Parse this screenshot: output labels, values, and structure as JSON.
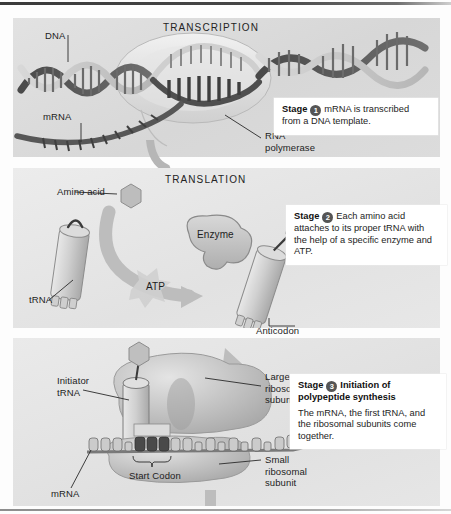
{
  "figure": {
    "background_color": "#fdfdfd",
    "panel_color": "#dedede"
  },
  "panels": [
    {
      "id": "transcription",
      "section_label": "TRANSCRIPTION",
      "labels": [
        {
          "name": "dna",
          "text": "DNA"
        },
        {
          "name": "mrna",
          "text": "mRNA"
        },
        {
          "name": "rna-polymerase",
          "text": "RNA\npolymerase"
        }
      ],
      "stage": {
        "word": "Stage",
        "number": "1",
        "title": "",
        "body": "mRNA is transcribed from a DNA template."
      }
    },
    {
      "id": "translation",
      "section_label": "TRANSLATION",
      "labels": [
        {
          "name": "amino-acid",
          "text": "Amino acid"
        },
        {
          "name": "trna",
          "text": "tRNA"
        },
        {
          "name": "enzyme",
          "text": "Enzyme"
        },
        {
          "name": "atp",
          "text": "ATP"
        },
        {
          "name": "anticodon",
          "text": "Anticodon"
        }
      ],
      "stage": {
        "word": "Stage",
        "number": "2",
        "title": "",
        "body": "Each amino acid attaches to its proper tRNA with the help of a specific enzyme and ATP."
      }
    },
    {
      "id": "initiation",
      "section_label": "",
      "labels": [
        {
          "name": "initiator-trna",
          "text": "Initiator\ntRNA"
        },
        {
          "name": "large-ribosomal-subunit",
          "text": "Large\nribosomal\nsubunit"
        },
        {
          "name": "small-ribosomal-subunit",
          "text": "Small\nribosomal\nsubunit"
        },
        {
          "name": "start-codon",
          "text": "Start Codon"
        },
        {
          "name": "mrna",
          "text": "mRNA"
        }
      ],
      "stage": {
        "word": "Stage",
        "number": "3",
        "title": "Initiation of polypeptide synthesis",
        "body": "The mRNA, the first tRNA, and the ribosomal subunits come together."
      }
    }
  ],
  "codon_bases": [
    "A",
    "U",
    "G"
  ],
  "colors": {
    "badge": "#555555",
    "text": "#242424",
    "leader_line": "#2a2a2a"
  }
}
